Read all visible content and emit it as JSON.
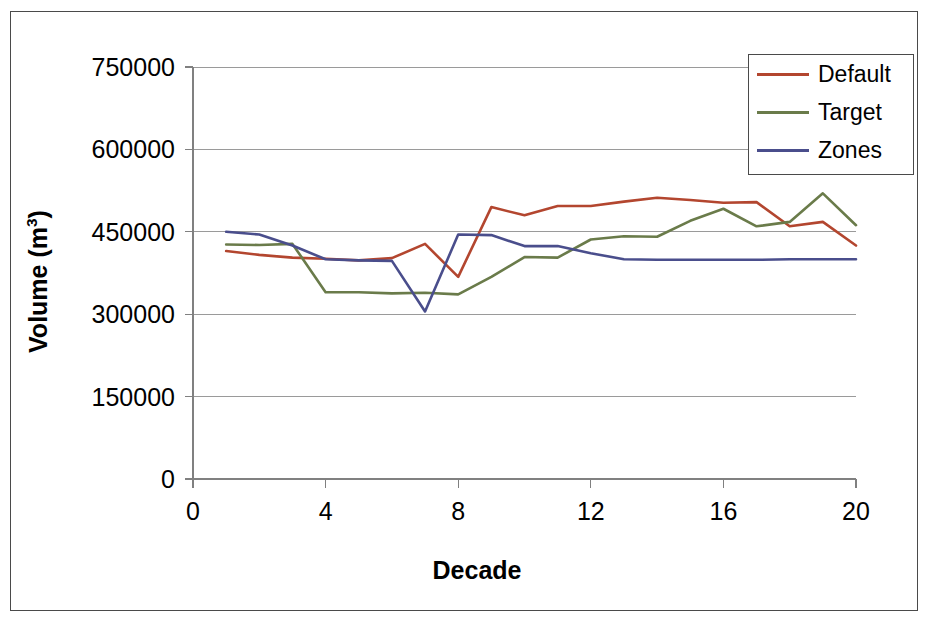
{
  "chart_data": {
    "type": "line",
    "title": "",
    "xlabel": "Decade",
    "ylabel": "Volume (m3)",
    "ylabel_base": "Volume (m",
    "ylabel_sup": "3",
    "ylabel_close": ")",
    "xlim": [
      0,
      20
    ],
    "ylim": [
      0,
      750000
    ],
    "grid": true,
    "grid_axis": "y",
    "legend_position": "top-right",
    "x": [
      1,
      2,
      3,
      4,
      5,
      6,
      7,
      8,
      9,
      10,
      11,
      12,
      13,
      14,
      15,
      16,
      17,
      18,
      19,
      20
    ],
    "xticks": [
      0,
      4,
      8,
      12,
      16,
      20
    ],
    "xtick_labels": [
      "0",
      "4",
      "8",
      "12",
      "16",
      "20"
    ],
    "yticks": [
      0,
      150000,
      300000,
      450000,
      600000,
      750000
    ],
    "ytick_labels": [
      "0",
      "150000",
      "300000",
      "450000",
      "600000",
      "750000"
    ],
    "series": [
      {
        "name": "Default",
        "color": "#B3462F",
        "values": [
          415000,
          408000,
          403000,
          401000,
          398000,
          402000,
          428000,
          368000,
          495000,
          480000,
          497000,
          497000,
          505000,
          512000,
          508000,
          503000,
          504000,
          460000,
          468000,
          425000
        ]
      },
      {
        "name": "Target",
        "color": "#6A7B4A",
        "values": [
          427000,
          426000,
          428000,
          340000,
          340000,
          338000,
          339000,
          336000,
          368000,
          404000,
          403000,
          436000,
          442000,
          441000,
          470000,
          492000,
          460000,
          468000,
          520000,
          462000
        ]
      },
      {
        "name": "Zones",
        "color": "#4A4E8C",
        "values": [
          450000,
          445000,
          425000,
          400000,
          398000,
          397000,
          305000,
          445000,
          444000,
          424000,
          424000,
          411000,
          400000,
          399000,
          399000,
          399000,
          399000,
          400000,
          400000,
          400000
        ]
      }
    ]
  },
  "legend": {
    "entries": [
      {
        "label": "Default",
        "color": "#B3462F"
      },
      {
        "label": "Target",
        "color": "#6A7B4A"
      },
      {
        "label": "Zones",
        "color": "#4A4E8C"
      }
    ]
  },
  "colors": {
    "default_series": "#B3462F",
    "target_series": "#6A7B4A",
    "zones_series": "#4A4E8C",
    "axis": "#808080",
    "grid": "#9a9a9a",
    "frame": "#4a4a4a",
    "text": "#000000",
    "background": "#ffffff"
  }
}
